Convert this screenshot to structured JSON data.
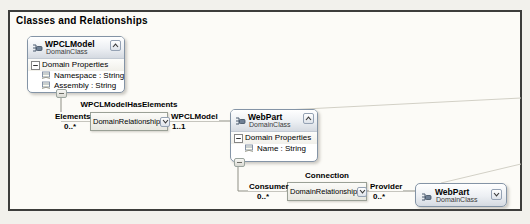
{
  "lane": {
    "title": "Classes and Relationships"
  },
  "shapes": {
    "wpclmodel": {
      "name": "WPCLModel",
      "kind": "DomainClass",
      "compartment": "Domain Properties",
      "properties": [
        "Namespace : String",
        "Assembly : String"
      ]
    },
    "webpart": {
      "name": "WebPart",
      "kind": "DomainClass",
      "compartment": "Domain Properties",
      "properties": [
        "Name : String"
      ]
    },
    "webpart_ref": {
      "name": "WebPart",
      "kind": "DomainClass"
    }
  },
  "relationships": {
    "wpclmodel_has_elements": {
      "title": "WPCLModelHasElements",
      "connector": "DomainRelationship",
      "source_role": "Elements",
      "source_multiplicity": "0..*",
      "target_role": "WPCLModel",
      "target_multiplicity": "1..1"
    },
    "connection": {
      "title": "Connection",
      "connector": "DomainRelationship",
      "source_role": "Consumer",
      "source_multiplicity": "0..*",
      "target_role": "Provider",
      "target_multiplicity": "0..*"
    }
  },
  "icons": {
    "domain_class_icon": "class-connector-glyph",
    "domain_property_icon": "property-sheet-glyph",
    "collapse_button": "chevron-up",
    "expand_button": "chevron-down",
    "compartment_expander": "minus-box"
  },
  "colors": {
    "canvas_bg": "#f2f1ec",
    "lane_bg": "#fcfbf7",
    "lane_border": "#3d3d3b",
    "shape_border": "#8494a6",
    "header_grad_top": "#ffffff",
    "header_grad_bottom": "#d5dae1",
    "connector_box_border": "#9aa096",
    "line": "#8f8f85",
    "faint_line": "#d2d0c6",
    "text": "#000000"
  }
}
